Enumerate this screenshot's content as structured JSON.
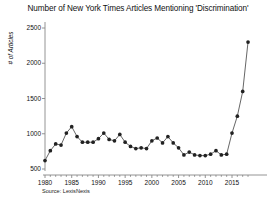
{
  "chart_data": {
    "type": "line",
    "title": "Number of New York Times Articles Mentioning 'Discrimination'",
    "xlabel": "",
    "ylabel": "# of Articles",
    "source": "Source: LexisNexis",
    "grid": false,
    "legend": "none",
    "marker": "filled-circle",
    "line_color": "#555555",
    "marker_color": "#222222",
    "axis_color": "#888888",
    "background": "#ffffff",
    "xlim": [
      1979,
      2019
    ],
    "ylim": [
      400,
      2600
    ],
    "xticks": [
      1980,
      1985,
      1990,
      1995,
      2000,
      2005,
      2010,
      2015
    ],
    "xtick_labels": [
      "1980",
      "1985",
      "1990",
      "1995",
      "2000",
      "2005",
      "2010",
      "2015"
    ],
    "yticks": [
      500,
      1000,
      1500,
      2000,
      2500
    ],
    "ytick_labels": [
      "500",
      "1000",
      "1500",
      "2000",
      "2500"
    ],
    "x": [
      1980,
      1981,
      1982,
      1983,
      1984,
      1985,
      1986,
      1987,
      1988,
      1989,
      1990,
      1991,
      1992,
      1993,
      1994,
      1995,
      1996,
      1997,
      1998,
      1999,
      2000,
      2001,
      2002,
      2003,
      2004,
      2005,
      2006,
      2007,
      2008,
      2009,
      2010,
      2011,
      2012,
      2013,
      2014,
      2015,
      2016,
      2017,
      2018
    ],
    "values": [
      620,
      760,
      855,
      840,
      1010,
      1100,
      960,
      880,
      880,
      880,
      930,
      1010,
      920,
      900,
      990,
      880,
      820,
      790,
      800,
      790,
      900,
      940,
      870,
      960,
      870,
      800,
      700,
      740,
      700,
      690,
      690,
      710,
      760,
      700,
      710,
      1010,
      1250,
      1600,
      2300
    ],
    "peak_value": 2300,
    "peak_year": 2017,
    "last_value": 2260,
    "last_year": 2018,
    "min_value": 620,
    "min_year": 1980
  }
}
